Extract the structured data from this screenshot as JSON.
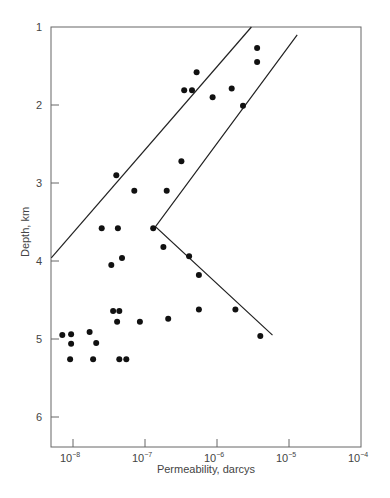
{
  "chart_data": {
    "type": "scatter",
    "title": "",
    "xlabel": "Permeability, darcys",
    "ylabel": "Depth, km",
    "xscale": "log",
    "xlim": [
      5e-09,
      0.0001
    ],
    "ylim": [
      6.35,
      1
    ],
    "y_inverted": true,
    "grid": false,
    "legend": null,
    "x_ticks": [
      {
        "value": 1e-08,
        "base": "10",
        "exp": "−8"
      },
      {
        "value": 1e-07,
        "base": "10",
        "exp": "−7"
      },
      {
        "value": 1e-06,
        "base": "10",
        "exp": "−6"
      },
      {
        "value": 1e-05,
        "base": "10",
        "exp": "−5"
      },
      {
        "value": 0.0001,
        "base": "10",
        "exp": "−4"
      }
    ],
    "y_ticks": [
      1,
      2,
      3,
      4,
      5,
      6
    ],
    "series": [
      {
        "name": "measurements",
        "marker": "filled-circle",
        "points": [
          {
            "x": 3.6e-06,
            "y": 1.27
          },
          {
            "x": 3.6e-06,
            "y": 1.45
          },
          {
            "x": 5.2e-07,
            "y": 1.58
          },
          {
            "x": 3.5e-07,
            "y": 1.81
          },
          {
            "x": 4.5e-07,
            "y": 1.81
          },
          {
            "x": 8.7e-07,
            "y": 1.9
          },
          {
            "x": 1.6e-06,
            "y": 1.79
          },
          {
            "x": 2.3e-06,
            "y": 2.01
          },
          {
            "x": 3.2e-07,
            "y": 2.72
          },
          {
            "x": 4e-08,
            "y": 2.9
          },
          {
            "x": 7.1e-08,
            "y": 3.1
          },
          {
            "x": 2e-07,
            "y": 3.1
          },
          {
            "x": 2.5e-08,
            "y": 3.58
          },
          {
            "x": 4.2e-08,
            "y": 3.58
          },
          {
            "x": 1.3e-07,
            "y": 3.58
          },
          {
            "x": 1.8e-07,
            "y": 3.82
          },
          {
            "x": 4.1e-07,
            "y": 3.94
          },
          {
            "x": 4.8e-08,
            "y": 3.96
          },
          {
            "x": 3.4e-08,
            "y": 4.05
          },
          {
            "x": 5.6e-07,
            "y": 4.18
          },
          {
            "x": 3.6e-08,
            "y": 4.64
          },
          {
            "x": 4.4e-08,
            "y": 4.64
          },
          {
            "x": 4.1e-08,
            "y": 4.78
          },
          {
            "x": 8.5e-08,
            "y": 4.78
          },
          {
            "x": 2.1e-07,
            "y": 4.74
          },
          {
            "x": 5.6e-07,
            "y": 4.62
          },
          {
            "x": 1.8e-06,
            "y": 4.62
          },
          {
            "x": 4e-06,
            "y": 4.96
          },
          {
            "x": 7.1e-09,
            "y": 4.95
          },
          {
            "x": 9.4e-09,
            "y": 4.94
          },
          {
            "x": 9.4e-09,
            "y": 5.06
          },
          {
            "x": 1.7e-08,
            "y": 4.91
          },
          {
            "x": 2.1e-08,
            "y": 5.05
          },
          {
            "x": 9.1e-09,
            "y": 5.26
          },
          {
            "x": 1.9e-08,
            "y": 5.26
          },
          {
            "x": 4.4e-08,
            "y": 5.26
          },
          {
            "x": 5.5e-08,
            "y": 5.26
          }
        ]
      }
    ],
    "annotation_lines": [
      {
        "name": "upper-bound-line",
        "points": [
          {
            "x": 5e-09,
            "y": 3.96
          },
          {
            "x": 3e-06,
            "y": 1.0
          }
        ]
      },
      {
        "name": "lower-bound-line",
        "points": [
          {
            "x": 1.3e-05,
            "y": 1.1
          },
          {
            "x": 1.4e-07,
            "y": 3.56
          },
          {
            "x": 5.9e-06,
            "y": 4.95
          }
        ]
      }
    ]
  }
}
